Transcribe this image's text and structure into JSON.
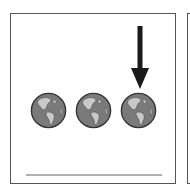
{
  "scene": {
    "description": "Three globe icons in a row with a downward arrow pointing at the third globe",
    "selected_index": 2,
    "globes": [
      {
        "name": "globe-1",
        "icon": "globe-americas-icon"
      },
      {
        "name": "globe-2",
        "icon": "globe-americas-icon"
      },
      {
        "name": "globe-3",
        "icon": "globe-americas-icon"
      }
    ],
    "arrow": {
      "icon": "arrow-down-icon",
      "points_to": "globe-3"
    }
  },
  "colors": {
    "ocean": "#7a7a7a",
    "land": "#c8c8c8",
    "outline": "#333333",
    "arrow": "#1a1a1a",
    "border": "#555555",
    "underline": "#b0b0b0"
  }
}
